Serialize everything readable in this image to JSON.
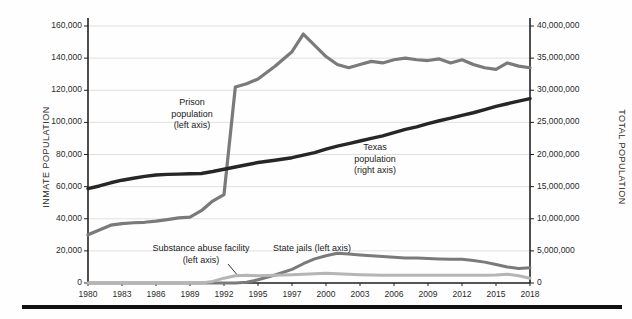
{
  "chart_data": {
    "type": "line",
    "title": "",
    "xlabel": "",
    "ylabel": "INMATE POPULATION",
    "y2label": "TOTAL POPULATION",
    "grid": true,
    "legend_position": "inline-annotations",
    "x": [
      1980,
      1981,
      1982,
      1983,
      1984,
      1985,
      1986,
      1987,
      1988,
      1989,
      1990,
      1991,
      1992,
      1993,
      1994,
      1995,
      1996,
      1997,
      1998,
      1999,
      2000,
      2001,
      2002,
      2003,
      2004,
      2005,
      2006,
      2007,
      2008,
      2009,
      2010,
      2011,
      2012,
      2013,
      2014,
      2015,
      2016,
      2017,
      2018
    ],
    "xticklabels": [
      "1980",
      "1983",
      "1986",
      "1989",
      "1992",
      "1995",
      "1997",
      "2000",
      "2003",
      "2006",
      "2009",
      "2012",
      "2015",
      "2018"
    ],
    "xtickvalues": [
      1980,
      1983,
      1986,
      1989,
      1992,
      1995,
      1997,
      2000,
      2003,
      2006,
      2009,
      2012,
      2015,
      2018
    ],
    "ylim": [
      0,
      160000
    ],
    "yticklabels": [
      "0",
      "20,000",
      "40,000",
      "60,000",
      "80,000",
      "100,000",
      "120,000",
      "140,000",
      "160,000"
    ],
    "ytickvalues": [
      0,
      20000,
      40000,
      60000,
      80000,
      100000,
      120000,
      140000,
      160000
    ],
    "y2lim": [
      0,
      40000000
    ],
    "y2ticklabels": [
      "0",
      "5,000,000",
      "10,000,000",
      "15,000,000",
      "20,000,000",
      "25,000,000",
      "30,000,000",
      "35,000,000",
      "40,000,000"
    ],
    "y2tickvalues": [
      0,
      5000000,
      10000000,
      15000000,
      20000000,
      25000000,
      30000000,
      35000000,
      40000000
    ],
    "series": [
      {
        "name": "Prison population (left axis)",
        "axis": "left",
        "color": "#7a7a7a",
        "width": 3.2,
        "values": [
          30000,
          33000,
          36000,
          37000,
          37500,
          37800,
          38500,
          39500,
          40500,
          41000,
          45000,
          51000,
          55000,
          122000,
          124000,
          127000,
          135000,
          144000,
          155000,
          148000,
          141000,
          136000,
          134000,
          136000,
          138000,
          137000,
          139000,
          140000,
          139000,
          138500,
          139500,
          137000,
          139000,
          136000,
          134000,
          133000,
          137000,
          135000,
          134000
        ]
      },
      {
        "name": "Texas population (right axis)",
        "axis": "right",
        "color": "#262626",
        "width": 3.4,
        "values": [
          14700000,
          15100000,
          15600000,
          16000000,
          16300000,
          16600000,
          16800000,
          16900000,
          16950000,
          17000000,
          17050000,
          17350000,
          17700000,
          18050000,
          18400000,
          18750000,
          19100000,
          19500000,
          19900000,
          20300000,
          20850000,
          21300000,
          21700000,
          22100000,
          22500000,
          22900000,
          23400000,
          23900000,
          24300000,
          24800000,
          25250000,
          25650000,
          26100000,
          26500000,
          27000000,
          27500000,
          27900000,
          28300000,
          28700000
        ]
      },
      {
        "name": "State jails (left axis)",
        "axis": "left",
        "color": "#7a7a7a",
        "width": 3.0,
        "values": [
          0,
          0,
          0,
          0,
          0,
          0,
          0,
          0,
          0,
          0,
          0,
          0,
          0,
          0,
          500,
          2000,
          5000,
          8500,
          12000,
          15000,
          17000,
          18500,
          18000,
          17500,
          17000,
          16500,
          16000,
          15500,
          15500,
          15200,
          15000,
          14800,
          14800,
          14000,
          13000,
          11500,
          10000,
          9000,
          9500
        ]
      },
      {
        "name": "Substance abuse facility (left axis)",
        "axis": "left",
        "color": "#b5b5b5",
        "width": 3.0,
        "values": [
          0,
          0,
          0,
          0,
          0,
          0,
          0,
          0,
          0,
          0,
          0,
          1000,
          3000,
          4500,
          4800,
          4500,
          4800,
          5200,
          5500,
          5800,
          6000,
          5800,
          5500,
          5200,
          5000,
          4800,
          4800,
          4800,
          4800,
          4800,
          4800,
          4800,
          4800,
          4800,
          4800,
          5000,
          5500,
          4500,
          3000
        ]
      }
    ],
    "annotations": [
      {
        "id": "prison",
        "lines": [
          "Prison",
          "population",
          "(left axis)"
        ]
      },
      {
        "id": "texas",
        "lines": [
          "Texas",
          "population",
          "(right axis)"
        ]
      },
      {
        "id": "state_jails",
        "lines": [
          "State jails (left axis)"
        ]
      },
      {
        "id": "substance_abuse",
        "lines": [
          "Substance abuse facility",
          "(left axis)"
        ]
      }
    ]
  },
  "axes": {
    "left_title": "INMATE POPULATION",
    "right_title": "TOTAL POPULATION"
  },
  "annotations": {
    "prison_l1": "Prison",
    "prison_l2": "population",
    "prison_l3": "(left axis)",
    "texas_l1": "Texas",
    "texas_l2": "population",
    "texas_l3": "(right axis)",
    "state_jails": "State jails (left axis)",
    "substance_l1": "Substance abuse facility",
    "substance_l2": "(left axis)"
  },
  "colors": {
    "prison": "#7a7a7a",
    "texas": "#262626",
    "state_jails": "#7a7a7a",
    "substance": "#b5b5b5",
    "grid": "#d8d8d8",
    "axis": "#222222",
    "rule": "#111111"
  }
}
